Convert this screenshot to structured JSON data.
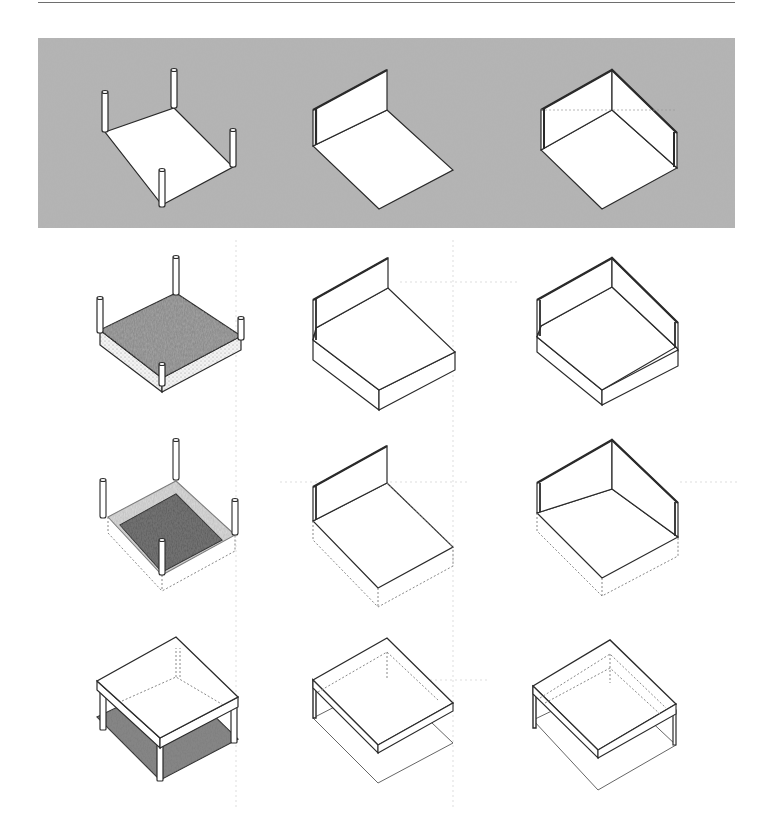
{
  "figure": {
    "type": "isometric architectural diagram",
    "rows": 4,
    "columns": 3,
    "colors": {
      "ink": "#2a2a2a",
      "dotted": "#8a8a8a",
      "ground_texture": "#9a9a9a",
      "paper": "#ffffff",
      "shaded_surface": "#8c8c8c",
      "dark_surface": "#555555"
    },
    "columns_meaning": [
      "plane with four corner columns",
      "plane with one vertical wall",
      "plane with two perpendicular walls"
    ],
    "rows_meaning": [
      "elements set on textured ground plane",
      "base plane raised as solid platform",
      "base plane depressed / sunken (dotted volume below)",
      "overhead plane (roof) with space defined below"
    ]
  },
  "cells": [
    {
      "row": 0,
      "col": 0,
      "label": "columns-on-ground"
    },
    {
      "row": 0,
      "col": 1,
      "label": "wall-on-ground"
    },
    {
      "row": 0,
      "col": 2,
      "label": "two-walls-on-ground"
    },
    {
      "row": 1,
      "col": 0,
      "label": "columns-raised-platform"
    },
    {
      "row": 1,
      "col": 1,
      "label": "wall-raised-platform"
    },
    {
      "row": 1,
      "col": 2,
      "label": "two-walls-raised-platform"
    },
    {
      "row": 2,
      "col": 0,
      "label": "columns-depressed-plane"
    },
    {
      "row": 2,
      "col": 1,
      "label": "wall-depressed-plane"
    },
    {
      "row": 2,
      "col": 2,
      "label": "two-walls-depressed-plane"
    },
    {
      "row": 3,
      "col": 0,
      "label": "columns-overhead-plane"
    },
    {
      "row": 3,
      "col": 1,
      "label": "wall-overhead-plane"
    },
    {
      "row": 3,
      "col": 2,
      "label": "two-walls-overhead-plane"
    }
  ]
}
